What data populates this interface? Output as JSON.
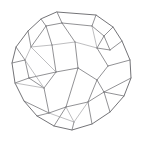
{
  "figure": {
    "kind": "3d-wireframe-line-drawing",
    "background_color": "#ffffff",
    "stroke_color": "#6e6e72",
    "silhouette_stroke_color": "#5a5a5e",
    "faint_stroke_color": "#9a9a9e",
    "stroke_width": 0.75,
    "canvas": {
      "width": 145,
      "height": 142
    },
    "shape_description": "Rounded-triangular silhouette wireframe solid resembling a truncated polyhedron with quadrilateral and pentagonal faces",
    "vertices": [
      {
        "id": "v0",
        "x": 57.0,
        "y": 12.0
      },
      {
        "id": "v1",
        "x": 96.0,
        "y": 15.0
      },
      {
        "id": "v2",
        "x": 113.0,
        "y": 27.0
      },
      {
        "id": "v3",
        "x": 122.0,
        "y": 41.0
      },
      {
        "id": "v4",
        "x": 130.0,
        "y": 60.0
      },
      {
        "id": "v5",
        "x": 131.0,
        "y": 78.0
      },
      {
        "id": "v6",
        "x": 124.0,
        "y": 96.0
      },
      {
        "id": "v7",
        "x": 110.0,
        "y": 112.0
      },
      {
        "id": "v8",
        "x": 92.0,
        "y": 124.0
      },
      {
        "id": "v9",
        "x": 72.0,
        "y": 130.0
      },
      {
        "id": "v10",
        "x": 54.0,
        "y": 126.0
      },
      {
        "id": "v11",
        "x": 37.0,
        "y": 116.0
      },
      {
        "id": "v12",
        "x": 24.0,
        "y": 101.0
      },
      {
        "id": "v13",
        "x": 15.0,
        "y": 83.0
      },
      {
        "id": "v14",
        "x": 12.0,
        "y": 63.0
      },
      {
        "id": "v15",
        "x": 16.0,
        "y": 47.0
      },
      {
        "id": "v16",
        "x": 28.0,
        "y": 31.0
      },
      {
        "id": "v17",
        "x": 41.0,
        "y": 19.0
      },
      {
        "id": "v18",
        "x": 46.0,
        "y": 26.0
      },
      {
        "id": "v19",
        "x": 62.0,
        "y": 23.0
      },
      {
        "id": "v20",
        "x": 92.0,
        "y": 26.0
      },
      {
        "id": "v21",
        "x": 104.0,
        "y": 36.0
      },
      {
        "id": "v22",
        "x": 110.0,
        "y": 50.0
      },
      {
        "id": "v23",
        "x": 97.0,
        "y": 48.0
      },
      {
        "id": "v24",
        "x": 75.0,
        "y": 42.0
      },
      {
        "id": "v25",
        "x": 52.0,
        "y": 45.0
      },
      {
        "id": "v26",
        "x": 31.0,
        "y": 47.0
      },
      {
        "id": "v27",
        "x": 25.0,
        "y": 60.0
      },
      {
        "id": "v28",
        "x": 29.0,
        "y": 78.0
      },
      {
        "id": "v29",
        "x": 44.0,
        "y": 88.0
      },
      {
        "id": "v30",
        "x": 56.0,
        "y": 72.0
      },
      {
        "id": "v31",
        "x": 78.0,
        "y": 68.0
      },
      {
        "id": "v32",
        "x": 97.0,
        "y": 80.0
      },
      {
        "id": "v33",
        "x": 108.0,
        "y": 66.0
      },
      {
        "id": "v34",
        "x": 88.0,
        "y": 102.0
      },
      {
        "id": "v35",
        "x": 66.0,
        "y": 107.0
      },
      {
        "id": "v36",
        "x": 49.0,
        "y": 113.0
      },
      {
        "id": "v37",
        "x": 104.0,
        "y": 92.0
      },
      {
        "id": "v38",
        "x": 74.0,
        "y": 122.0
      }
    ],
    "edge_count": 54,
    "outline_path": "M57,12 L96,15 L113,27 L122,41 L130,60 L131,78 L124,96 L110,112 L92,124 L72,130 L54,126 L37,116 L24,101 L15,83 L12,63 L16,47 L28,31 L41,19 Z"
  }
}
